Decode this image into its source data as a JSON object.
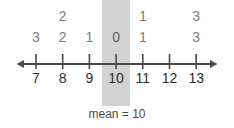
{
  "chart_data": {
    "type": "table",
    "title": "",
    "subtitle": "",
    "xlabel": "",
    "ylabel": "",
    "xlim": [
      7,
      13
    ],
    "grid": false,
    "legend": null,
    "axis": {
      "orientation": "horizontal",
      "left_arrow": true,
      "right_arrow": true,
      "tick_labels": [
        "7",
        "8",
        "9",
        "10",
        "11",
        "12",
        "13"
      ],
      "tick_values": [
        7,
        8,
        9,
        10,
        11,
        12,
        13
      ]
    },
    "categories": [
      "7",
      "8",
      "9",
      "10",
      "11",
      "12",
      "13"
    ],
    "columns": [
      {
        "x": "7",
        "values": [
          "",
          "3"
        ]
      },
      {
        "x": "8",
        "values": [
          "2",
          "2"
        ]
      },
      {
        "x": "9",
        "values": [
          "",
          "1"
        ]
      },
      {
        "x": "10",
        "values": [
          "",
          "0"
        ]
      },
      {
        "x": "11",
        "values": [
          "1",
          "1"
        ]
      },
      {
        "x": "12",
        "values": [
          "",
          ""
        ]
      },
      {
        "x": "13",
        "values": [
          "3",
          "3"
        ]
      }
    ],
    "annotations": [
      {
        "name": "mean-caption",
        "text": "mean = 10"
      },
      {
        "name": "mean-highlight",
        "at": "10"
      }
    ]
  },
  "caption": {
    "text": "mean = 10"
  },
  "colors": {
    "band": "#d2d2d2",
    "axis": "#4a4a4a",
    "deviation_text": "#7d7d7d",
    "tick_text": "#2f2f2f",
    "caption_text": "#4a4a4a",
    "background": "#ffffff"
  }
}
